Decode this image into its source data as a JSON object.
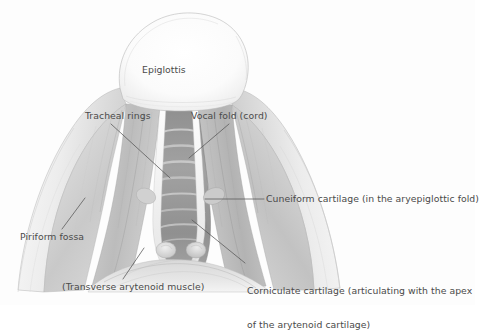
{
  "figure": {
    "kind": "anatomical-illustration",
    "style": "grayscale pencil / wash drawing on white background",
    "text_color": "#4a4a4a",
    "background_color": "#fdfdfd",
    "leader_line_color": "#555555"
  },
  "labels": {
    "epiglottis": "Epiglottis",
    "tracheal_rings": "Tracheal rings",
    "vocal_fold": "Vocal fold (cord)",
    "cuneiform_cartilage": "Cuneiform cartilage (in the aryepiglottic fold)",
    "piriform_fossa": "Piriform fossa",
    "corniculate_cartilage_line1": "Corniculate cartilage (articulating with the apex",
    "corniculate_cartilage_line2": "of the arytenoid cartilage)",
    "transverse_arytenoid_muscle": "(Transverse arytenoid muscle)"
  }
}
